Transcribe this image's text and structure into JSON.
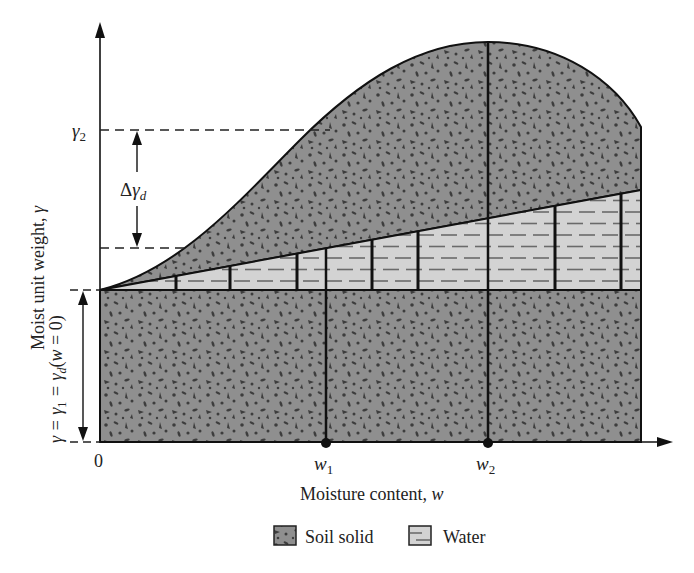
{
  "figure": {
    "x_axis_label": "Moisture content, ",
    "x_axis_var": "w",
    "y_axis_label": "Moist unit weight, ",
    "y_axis_var": "γ",
    "origin_label": "0",
    "x_ticks": [
      {
        "base": "w",
        "sub": "1"
      },
      {
        "base": "w",
        "sub": "2"
      }
    ],
    "y_top_label": {
      "base": "γ",
      "sub": "2"
    },
    "delta_label": {
      "prefix": "Δ",
      "base": "γ",
      "sub": "d"
    },
    "y_base_label": {
      "part1": "γ = γ",
      "sub1": "1",
      "part2": " = γ",
      "sub2": "d",
      "part3": "(",
      "var": "w",
      "part4": " = 0)"
    }
  },
  "legend": {
    "items": [
      {
        "name": "soil-solid",
        "label": "Soil solid"
      },
      {
        "name": "water",
        "label": "Water"
      }
    ]
  },
  "colors": {
    "soil_fill": "#8f8f8f",
    "soil_speck": "#3d3d3d",
    "water_fill": "#d3d3d3",
    "water_dash": "#6a6a6a",
    "line": "#111111"
  }
}
